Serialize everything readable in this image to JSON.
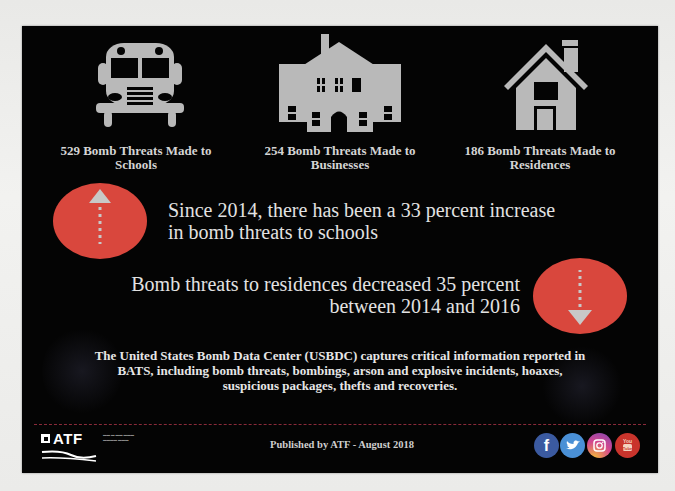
{
  "categories": [
    {
      "id": "schools",
      "icon": "school-bus-icon",
      "count": 529,
      "label": "529 Bomb Threats Made to Schools",
      "line1": "529 Bomb Threats Made to",
      "line2": "Schools"
    },
    {
      "id": "businesses",
      "icon": "building-icon",
      "count": 254,
      "label": "254 Bomb Threats Made to Businesses",
      "line1": "254 Bomb Threats Made to",
      "line2": "Businesses"
    },
    {
      "id": "residences",
      "icon": "house-icon",
      "count": 186,
      "label": "186 Bomb Threats Made to Residences",
      "line1": "186 Bomb Threats Made to",
      "line2": "Residences"
    }
  ],
  "stats": {
    "increase": {
      "icon": "arrow-up-icon",
      "line1": "Since 2014, there has been a 33 percent increase",
      "line2": "in bomb threats to schools",
      "percent": 33
    },
    "decrease": {
      "icon": "arrow-down-icon",
      "line1": "Bomb threats to residences decreased 35 percent",
      "line2": "between 2014 and 2016",
      "percent": 35
    }
  },
  "description": {
    "line1": "The United States Bomb Data Center (USBDC) captures critical information reported in",
    "line2": "BATS, including bomb threats, bombings, arson and explosive incidents, hoaxes,",
    "line3": "suspicious packages, thefts and recoveries."
  },
  "footer": {
    "logo_text": "ATF",
    "published": "Published by ATF - August 2018",
    "social": [
      {
        "name": "facebook",
        "glyph": "f",
        "color": "#3b5aa0"
      },
      {
        "name": "twitter",
        "glyph": "🐦",
        "color": "#4a90d6"
      },
      {
        "name": "instagram",
        "glyph": "◎",
        "color": "#c0569a"
      },
      {
        "name": "youtube",
        "glyph": "You",
        "color": "#c9342c"
      }
    ]
  },
  "colors": {
    "panel": "#040404",
    "accent_red": "#d9473d",
    "icon_gray": "#b9b9b9",
    "divider": "#8a2a3a"
  }
}
